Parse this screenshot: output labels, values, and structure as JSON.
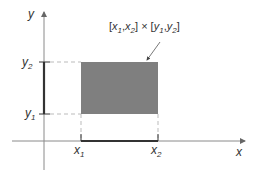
{
  "diagram": {
    "axes": {
      "x_label": "x",
      "y_label": "y"
    },
    "x_ticks": {
      "x1": {
        "base": "x",
        "sub": "1"
      },
      "x2": {
        "base": "x",
        "sub": "2"
      }
    },
    "y_ticks": {
      "y1": {
        "base": "y",
        "sub": "1"
      },
      "y2": {
        "base": "y",
        "sub": "2"
      }
    },
    "region_label": {
      "open1": "[",
      "x": "x",
      "s1": "1",
      "comma1": ",",
      "x_b": "x",
      "s2": "2",
      "close_times": "] × [",
      "y": "y",
      "s3": "1",
      "comma2": ",",
      "y_b": "y",
      "s4": "2",
      "close": "]"
    },
    "colors": {
      "rectangle_fill": "#7f7f7f",
      "axis": "#8a8a8a",
      "interval": "#333333",
      "dashed": "#bbbbbb"
    }
  }
}
